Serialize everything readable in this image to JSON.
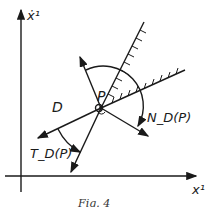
{
  "figure": {
    "caption": "Fig. 4",
    "labels": {
      "y_axis": "ẋ¹",
      "x_axis": "x¹",
      "point": "P",
      "region": "D",
      "normal_cone": "N_D(P)",
      "tangent_cone": "T_D(P)"
    },
    "colors": {
      "ink": "#1a1a1a",
      "background": "#ffffff"
    }
  }
}
